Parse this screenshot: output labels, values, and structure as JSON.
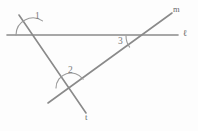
{
  "figure": {
    "background_color": "#fdfdfd",
    "line_color": "#8a8a8a",
    "arc_color": "#9a9a9a",
    "label_color": "#6f6f6f",
    "width": 198,
    "height": 131
  },
  "lines": [
    {
      "name": "l",
      "label": "ℓ",
      "description": "horizontal line",
      "x1": 7,
      "y1": 35,
      "x2": 178,
      "y2": 35,
      "label_x": 183,
      "label_y": 29
    },
    {
      "name": "t",
      "label": "t",
      "description": "transversal line sloping down to the right",
      "x1": 19,
      "y1": 15,
      "x2": 86,
      "y2": 113,
      "label_x": 85,
      "label_y": 113
    },
    {
      "name": "m",
      "label": "m",
      "description": "line sloping up to the right",
      "x1": 48,
      "y1": 103,
      "x2": 172,
      "y2": 13,
      "label_x": 173,
      "label_y": 5
    }
  ],
  "intersections": [
    {
      "name": "l-and-t",
      "x": 33,
      "y": 35
    },
    {
      "name": "t-and-m",
      "x": 71,
      "y": 88
    },
    {
      "name": "l-and-m",
      "x": 145,
      "y": 36
    }
  ],
  "angles": [
    {
      "id": "angle-1",
      "label": "1",
      "vertex_x": 33,
      "vertex_y": 35,
      "arc_radius": 17,
      "arc_start_deg": 180,
      "arc_end_deg": 304,
      "label_x": 35,
      "label_y": 12
    },
    {
      "id": "angle-2",
      "label": "2",
      "vertex_x": 71,
      "vertex_y": 88,
      "arc_radius": 15,
      "arc_start_deg": 180,
      "arc_end_deg": 324,
      "label_x": 68,
      "label_y": 66
    },
    {
      "id": "angle-3",
      "label": "3",
      "vertex_x": 145,
      "vertex_y": 36,
      "arc_radius": 19,
      "arc_start_deg": 144,
      "arc_end_deg": 180,
      "label_x": 118,
      "label_y": 37
    }
  ]
}
